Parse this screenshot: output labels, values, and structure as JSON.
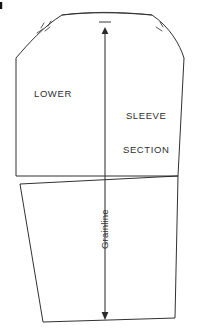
{
  "diagram": {
    "type": "sewing-pattern-piece",
    "background_color": "#ffffff",
    "line_color": "#1a1a1a",
    "text_color": "#2f2f2f"
  },
  "labels": {
    "lower": "LOWER",
    "sleeve_section_line1": "SLEEVE",
    "sleeve_section_line2": "SECTION",
    "grainline": "Grainline"
  },
  "markings": {
    "notch_count_left": 2,
    "notch_count_right": 1,
    "grainline_orientation": "vertical",
    "grainline_arrow_top": "up",
    "grainline_arrow_bottom": "down"
  },
  "geometry": {
    "canvas_width": 204,
    "canvas_height": 333,
    "grainline_x": 105,
    "grainline_top_y": 28,
    "grainline_bottom_y": 320,
    "upper_piece": {
      "cap_apex_left_x": 62,
      "cap_apex_right_x": 152,
      "cap_top_y": 14,
      "shoulder_left": [
        16,
        58
      ],
      "shoulder_right": [
        184,
        58
      ],
      "bottom_left": [
        16,
        176
      ],
      "bottom_right": [
        178,
        176
      ]
    },
    "lower_piece": {
      "top_left": [
        20,
        184
      ],
      "top_right": [
        178,
        176
      ],
      "bottom_left": [
        43,
        322
      ],
      "bottom_right": [
        175,
        318
      ]
    }
  }
}
